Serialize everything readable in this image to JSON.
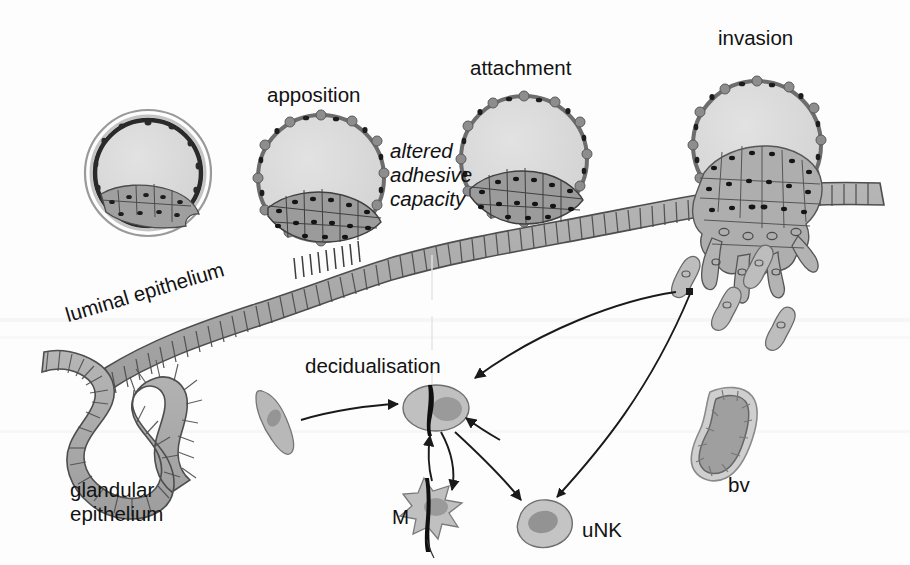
{
  "figure": {
    "background_color": "#fdfdfd",
    "ink_color": "#121212",
    "cell_fill_mid": "#a9a9a9",
    "cell_fill_light": "#d6d6d6",
    "cell_fill_dark": "#8a8a8a",
    "outline_color": "#555555"
  },
  "labels": {
    "apposition": "apposition",
    "attachment": "attachment",
    "invasion": "invasion",
    "altered_adhesive_capacity": [
      "altered",
      "adhesive",
      "capacity"
    ],
    "luminal_epithelium": "luminal epithelium",
    "glandular_epithelium": [
      "glandular",
      "epithelium"
    ],
    "decidualisation": "decidualisation",
    "macrophage": "M",
    "uterine_natural_killer": "uNK",
    "blood_vessel": "bv"
  },
  "stages": [
    {
      "id": "zona-blastocyst",
      "name": "blastocyst with zona pellucida",
      "label": "",
      "cx": 148,
      "cy": 173,
      "r": 62
    },
    {
      "id": "apposition-blastocyst",
      "name": "blastocyst apposition",
      "label": "apposition",
      "cx": 321,
      "cy": 178,
      "r": 62
    },
    {
      "id": "attachment-blastocyst",
      "name": "blastocyst attachment",
      "label": "attachment",
      "cx": 524,
      "cy": 159,
      "r": 62
    },
    {
      "id": "invasion-blastocyst",
      "name": "blastocyst invasion",
      "label": "invasion",
      "cx": 757,
      "cy": 145,
      "r": 64
    }
  ],
  "cells": {
    "stromal_fibroblast": {
      "name": "stromal fibroblast",
      "x": 274,
      "y": 414
    },
    "decidual_cell": {
      "name": "decidual cell",
      "x": 436,
      "y": 408
    },
    "macrophage_cell": {
      "name": "macrophage",
      "x": 424,
      "y": 507
    },
    "unk_cell": {
      "name": "uterine natural killer cell",
      "x": 543,
      "y": 523
    },
    "blood_vessel_shape": {
      "name": "blood vessel",
      "x": 722,
      "y": 432
    },
    "trophoblasts": [
      {
        "x": 689,
        "y": 275
      },
      {
        "x": 760,
        "y": 262
      },
      {
        "x": 731,
        "y": 303
      },
      {
        "x": 773,
        "y": 325
      }
    ]
  },
  "arrows": [
    {
      "from": "stromal fibroblast",
      "to": "decidual cell",
      "style": "curved"
    },
    {
      "from": "trophoblast",
      "to": "decidual cell",
      "style": "curved-double"
    },
    {
      "from": "decidual cell",
      "to": "macrophage",
      "style": "curved-double"
    },
    {
      "from": "decidual cell",
      "to": "uNK cell",
      "style": "curved"
    },
    {
      "from": "uNK cell",
      "to": "trophoblast",
      "style": "curved"
    }
  ]
}
